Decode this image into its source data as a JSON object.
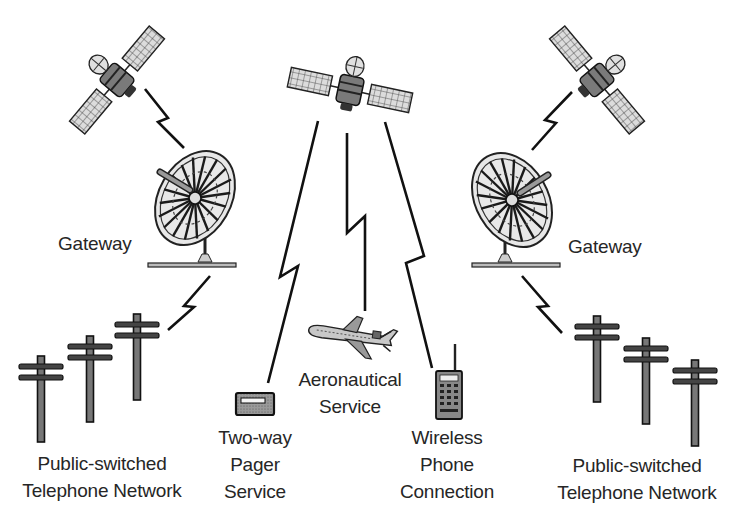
{
  "diagram": {
    "colors": {
      "ink": "#1a1a1a",
      "panel_fill": "#d8d8d8",
      "body_fill": "#6e6e6e",
      "screen_fill": "#f2f2f2",
      "background": "#ffffff"
    },
    "nodes": [
      {
        "id": "satellite-left",
        "type": "satellite"
      },
      {
        "id": "satellite-center",
        "type": "satellite"
      },
      {
        "id": "satellite-right",
        "type": "satellite"
      },
      {
        "id": "gateway-left",
        "type": "dish",
        "label": "Gateway"
      },
      {
        "id": "gateway-right",
        "type": "dish",
        "label": "Gateway"
      },
      {
        "id": "pstn-left",
        "type": "telephone-poles",
        "label_lines": [
          "Public-switched",
          "Telephone Network"
        ]
      },
      {
        "id": "pstn-right",
        "type": "telephone-poles",
        "label_lines": [
          "Public-switched",
          "Telephone Network"
        ]
      },
      {
        "id": "pager",
        "type": "pager",
        "label_lines": [
          "Two-way",
          "Pager",
          "Service"
        ]
      },
      {
        "id": "airplane",
        "type": "airplane",
        "label_lines": [
          "Aeronautical",
          "Service"
        ]
      },
      {
        "id": "phone",
        "type": "mobile-phone",
        "label_lines": [
          "Wireless",
          "Phone",
          "Connection"
        ]
      }
    ],
    "links": [
      {
        "from": "satellite-left",
        "to": "gateway-left",
        "style": "lightning"
      },
      {
        "from": "gateway-left",
        "to": "pstn-left",
        "style": "lightning"
      },
      {
        "from": "satellite-right",
        "to": "gateway-right",
        "style": "lightning"
      },
      {
        "from": "gateway-right",
        "to": "pstn-right",
        "style": "lightning"
      },
      {
        "from": "satellite-center",
        "to": "pager",
        "style": "lightning"
      },
      {
        "from": "satellite-center",
        "to": "airplane",
        "style": "lightning"
      },
      {
        "from": "satellite-center",
        "to": "phone",
        "style": "lightning"
      }
    ]
  },
  "labels": {
    "gateway_left": "Gateway",
    "gateway_right": "Gateway",
    "pstn_left": [
      "Public-switched",
      "Telephone Network"
    ],
    "pstn_right": [
      "Public-switched",
      "Telephone Network"
    ],
    "pager": [
      "Two-way",
      "Pager",
      "Service"
    ],
    "aero": [
      "Aeronautical",
      "Service"
    ],
    "phone": [
      "Wireless",
      "Phone",
      "Connection"
    ]
  }
}
